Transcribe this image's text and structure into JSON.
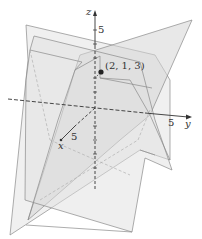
{
  "diagram": {
    "type": "3d-planes-intersection",
    "axes": {
      "x": {
        "label": "x",
        "tick_label": "5"
      },
      "y": {
        "label": "y",
        "tick_label": "5"
      },
      "z": {
        "label": "z",
        "tick_label": "5"
      }
    },
    "point": {
      "label": "(2, 1, 3)"
    },
    "colors": {
      "plane_fill": "#d9d9d9",
      "plane_stroke": "#7a7a7a",
      "axis": "#333333",
      "hidden": "#9a9a9a"
    }
  }
}
